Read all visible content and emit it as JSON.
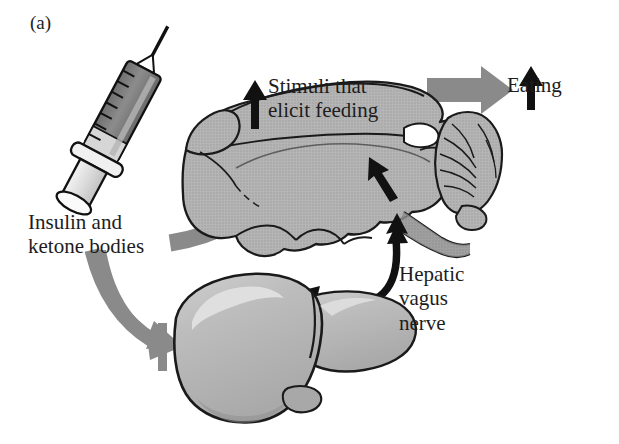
{
  "figure": {
    "panel_label": "(a)",
    "background_color": "#ffffff",
    "organ_fill": "#b3b3b3",
    "organ_outline": "#1a1a1a",
    "gray_arrow_color": "#8a8a8a",
    "black_arrow_color": "#111111",
    "syringe_fluid_color": "#8c8c8c",
    "syringe_body_color": "#d8d8d8"
  },
  "labels": {
    "stimuli": "Stimuli that\nelicit feeding",
    "eating": "Eating",
    "insulin": "Insulin and\nketone bodies",
    "hepatic": "Hepatic\nvagus\nnerve"
  },
  "icons": {
    "up_arrow_stimuli": "up-arrow-icon",
    "up_arrow_eating": "up-arrow-icon",
    "inhibition_bar": "inhibition-bar-icon"
  },
  "diagram_elements": {
    "syringe": "syringe-illustration",
    "brain": "rodent-brain-sagittal",
    "cerebellum": "cerebellum",
    "liver": "liver-illustration",
    "gallbladder": "gallbladder",
    "vagus_nerve": "hepatic-vagus-nerve-pathway",
    "afferent_arrow_to_brain": "gray-arrow-liver-to-brain",
    "efferent_arrow_to_eating": "gray-arrow-brain-to-eating",
    "injection_arrow_to_liver": "gray-arrow-syringe-to-liver"
  }
}
